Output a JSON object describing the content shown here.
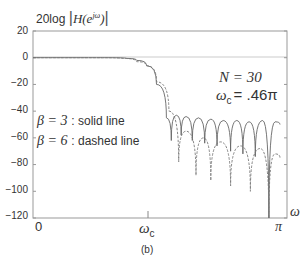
{
  "figure": {
    "ylabel_prefix": "20log",
    "ylabel_func": "H(e",
    "ylabel_sup": "jω",
    "ylabel_close": ")",
    "xlabel": "ω",
    "caption": "(b)",
    "annotation_N": "N = 30",
    "annotation_wc_sym": "ω",
    "annotation_wc_sub": "c",
    "annotation_wc_val": "= .46π",
    "legend_solid_beta": "β = 3",
    "legend_solid_text": ": solid line",
    "legend_dashed_beta": "β = 6",
    "legend_dashed_text": ": dashed line",
    "xtick_0": "0",
    "xtick_wc_sym": "ω",
    "xtick_wc_sub": "c",
    "xtick_pi": "π",
    "yticks": [
      "20",
      "0",
      "−20",
      "−40",
      "−60",
      "−80",
      "−100",
      "−120"
    ]
  },
  "chart_data": {
    "type": "line",
    "title": "",
    "xlabel": "ω",
    "ylabel": "20log|H(e^{jω})|",
    "xlim": [
      0,
      3.1416
    ],
    "ylim": [
      -120,
      20
    ],
    "x_ticks": [
      "0",
      "ω_c",
      "π"
    ],
    "y_ticks": [
      20,
      0,
      -20,
      -40,
      -60,
      -80,
      -100,
      -120
    ],
    "grid": false,
    "annotations": [
      "N = 30",
      "ω_c = .46π",
      "β = 3 : solid line",
      "β = 6 : dashed line",
      "(b)"
    ],
    "series": [
      {
        "name": "β = 3 (solid)",
        "style": "solid",
        "points_x_over_pi": [
          0,
          0.3,
          0.38,
          0.42,
          0.46,
          0.5,
          0.54,
          0.56,
          0.58,
          0.6,
          0.62,
          0.645,
          0.67,
          0.695,
          0.72,
          0.745,
          0.77,
          0.8,
          0.825,
          0.85,
          0.875,
          0.9,
          0.93,
          0.955,
          0.98,
          1.0
        ],
        "values_db": [
          0,
          0,
          -0.5,
          -2,
          -6,
          -20,
          -45,
          -62,
          -43,
          -58,
          -44,
          -62,
          -45,
          -64,
          -46,
          -66,
          -47,
          -70,
          -47,
          -72,
          -48,
          -74,
          -47,
          -120,
          -48,
          -50
        ]
      },
      {
        "name": "β = 6 (dashed)",
        "style": "dashed",
        "points_x_over_pi": [
          0,
          0.28,
          0.36,
          0.42,
          0.46,
          0.5,
          0.55,
          0.59,
          0.62,
          0.66,
          0.69,
          0.72,
          0.76,
          0.8,
          0.84,
          0.88,
          0.92,
          0.955,
          0.98,
          1.0
        ],
        "values_db": [
          0,
          0,
          -0.5,
          -3,
          -6,
          -18,
          -40,
          -78,
          -55,
          -88,
          -60,
          -92,
          -63,
          -96,
          -66,
          -100,
          -68,
          -120,
          -72,
          -75
        ]
      }
    ]
  }
}
